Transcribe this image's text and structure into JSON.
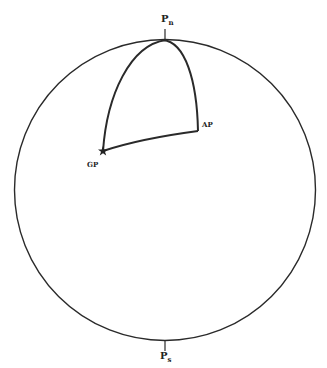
{
  "diagram": {
    "type": "celestial-sphere / navigational triangle",
    "labels": {
      "north_pole": {
        "main": "P",
        "sub": "n"
      },
      "south_pole": {
        "main": "P",
        "sub": "s"
      },
      "assumed_position": "AP",
      "geographic_position": "GP"
    },
    "colors": {
      "line": "#2a2a2a",
      "background": "#ffffff"
    }
  }
}
